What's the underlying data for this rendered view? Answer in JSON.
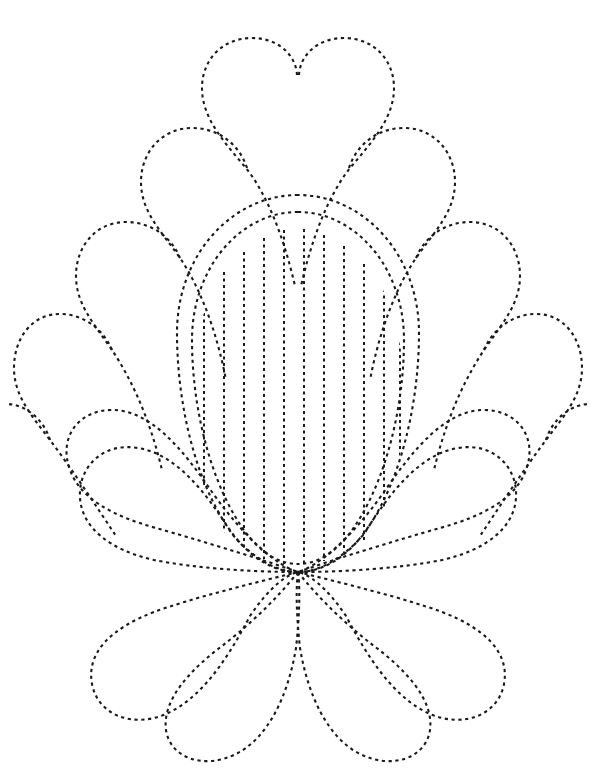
{
  "document": {
    "title": "Feathered Flower Quilting Pattern",
    "type": "line-art-template",
    "description": "Dotted-outline feathered flower / quilting stencil",
    "width": 597,
    "height": 783,
    "background_color": "#ffffff",
    "stroke_color": "#1a1a1a"
  },
  "design": {
    "center_x": 298,
    "center_y": 400,
    "convergence_point_x": 298,
    "convergence_point_y": 572,
    "petal_count": 16,
    "line_style": "dotted",
    "stroke_width": 2.1,
    "dash_pattern": "3.2 3.6"
  },
  "center_oval": {
    "outer": {
      "cx": 298,
      "cy": 393,
      "rx": 123,
      "ry": 198
    },
    "inner": {
      "cx": 298,
      "cy": 400,
      "rx": 107,
      "ry": 182
    },
    "fill_lines": 13,
    "fill_line_spacing": 20
  },
  "fill_lines": [
    {
      "x": 184,
      "y_top": 352,
      "y_bottom": 468
    },
    {
      "x": 204,
      "y_top": 300,
      "y_bottom": 512
    },
    {
      "x": 224,
      "y_top": 272,
      "y_bottom": 534
    },
    {
      "x": 244,
      "y_top": 252,
      "y_bottom": 549
    },
    {
      "x": 264,
      "y_top": 238,
      "y_bottom": 559
    },
    {
      "x": 284,
      "y_top": 230,
      "y_bottom": 564
    },
    {
      "x": 304,
      "y_top": 229,
      "y_bottom": 564
    },
    {
      "x": 324,
      "y_top": 235,
      "y_bottom": 561
    },
    {
      "x": 344,
      "y_top": 246,
      "y_bottom": 553
    },
    {
      "x": 364,
      "y_top": 264,
      "y_bottom": 540
    },
    {
      "x": 384,
      "y_top": 289,
      "y_bottom": 520
    },
    {
      "x": 400,
      "y_top": 316,
      "y_bottom": 498
    },
    {
      "x": 412,
      "y_top": 344,
      "y_bottom": 474
    }
  ],
  "petals": [
    {
      "id": "petal-top-left",
      "side": "left",
      "index": 0,
      "tip_x": 238,
      "tip_y": 45
    },
    {
      "id": "petal-upper-left-1",
      "side": "left",
      "index": 1,
      "tip_x": 158,
      "tip_y": 100
    },
    {
      "id": "petal-upper-left-2",
      "side": "left",
      "index": 2,
      "tip_x": 100,
      "tip_y": 158
    },
    {
      "id": "petal-mid-left-1",
      "side": "left",
      "index": 3,
      "tip_x": 62,
      "tip_y": 228
    },
    {
      "id": "petal-mid-left-2",
      "side": "left",
      "index": 4,
      "tip_x": 42,
      "tip_y": 310
    },
    {
      "id": "petal-lower-left-1",
      "side": "left",
      "index": 5,
      "tip_x": 36,
      "tip_y": 400
    },
    {
      "id": "petal-lower-left-2",
      "side": "left",
      "index": 6,
      "tip_x": 62,
      "tip_y": 500
    },
    {
      "id": "petal-bottom-left",
      "side": "left",
      "index": 7,
      "tip_x": 125,
      "tip_y": 600
    },
    {
      "id": "petal-bottom-heart-l",
      "side": "left",
      "index": 8,
      "tip_x": 205,
      "tip_y": 690
    },
    {
      "id": "petal-top-right",
      "side": "right",
      "index": 0,
      "tip_x": 358,
      "tip_y": 45
    },
    {
      "id": "petal-upper-right-1",
      "side": "right",
      "index": 1,
      "tip_x": 438,
      "tip_y": 100
    },
    {
      "id": "petal-upper-right-2",
      "side": "right",
      "index": 2,
      "tip_x": 496,
      "tip_y": 158
    },
    {
      "id": "petal-mid-right-1",
      "side": "right",
      "index": 3,
      "tip_x": 534,
      "tip_y": 228
    },
    {
      "id": "petal-mid-right-2",
      "side": "right",
      "index": 4,
      "tip_x": 554,
      "tip_y": 310
    },
    {
      "id": "petal-lower-right-1",
      "side": "right",
      "index": 5,
      "tip_x": 560,
      "tip_y": 400
    },
    {
      "id": "petal-lower-right-2",
      "side": "right",
      "index": 6,
      "tip_x": 534,
      "tip_y": 500
    },
    {
      "id": "petal-bottom-right",
      "side": "right",
      "index": 7,
      "tip_x": 471,
      "tip_y": 600
    },
    {
      "id": "petal-bottom-heart-r",
      "side": "right",
      "index": 8,
      "tip_x": 391,
      "tip_y": 690
    }
  ]
}
